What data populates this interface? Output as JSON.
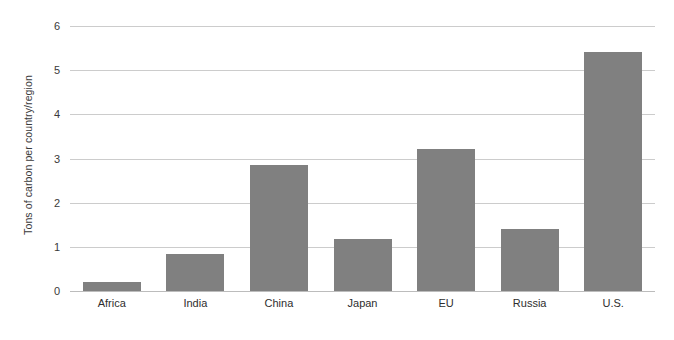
{
  "chart_data": {
    "type": "bar",
    "title": "",
    "subtitle": "",
    "xlabel": "",
    "ylabel": "Tons of carbon per country/region",
    "categories": [
      "Africa",
      "India",
      "China",
      "Japan",
      "EU",
      "Russia",
      "U.S."
    ],
    "values": [
      0.2,
      0.84,
      2.85,
      1.18,
      3.21,
      1.4,
      5.41
    ],
    "ylim": [
      0,
      6
    ],
    "ytick_labels": [
      "0",
      "1",
      "2",
      "3",
      "4",
      "5",
      "6"
    ],
    "ytick_values": [
      0,
      1,
      2,
      3,
      4,
      5,
      6
    ],
    "grid": true,
    "legend": false,
    "bar_color": "#808080",
    "gridline_color": "#cccccc",
    "axis_text_color": "#3a3a3a",
    "background_color": "#ffffff"
  }
}
